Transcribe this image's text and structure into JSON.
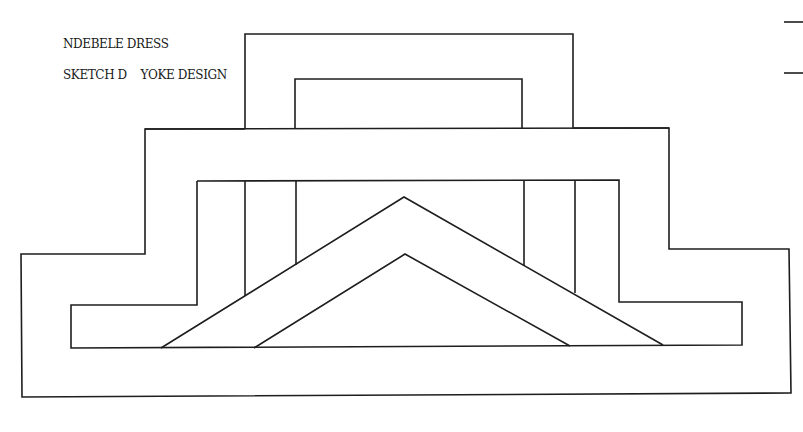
{
  "sketch": {
    "title": "NDEBELE DRESS",
    "subtitle": "SKETCH D    YOKE DESIGN"
  },
  "colors": {
    "background": "#ffffff",
    "ink": "#1e1e1e"
  }
}
